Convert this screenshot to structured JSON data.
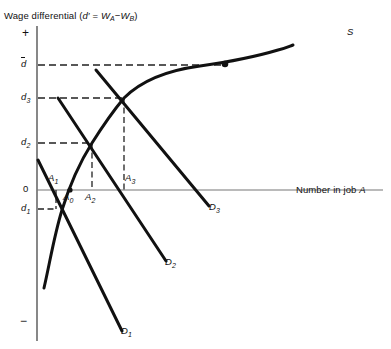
{
  "figure": {
    "width": 391,
    "height": 349,
    "background": "#ffffff",
    "ink": "#111111",
    "axis_color": "#555555",
    "title": "Wage differential (d′ = W",
    "title_full": "Wage differential (d' = WA−WB)",
    "title_parts": {
      "lead": "Wage differential (",
      "d": "d",
      "prime": "′",
      "eq": " = ",
      "w1": "W",
      "sub1": "A",
      "minus": "−",
      "w2": "W",
      "sub2": "B",
      "close": ")"
    },
    "x_axis_label": "Number in job A",
    "x_axis_label_parts": {
      "text": "Number in job ",
      "italic": "A"
    },
    "y_axis_plus": "+",
    "y_axis_minus": "−",
    "y_ticks": [
      {
        "id": "dbar",
        "label": "d",
        "accent": "bar",
        "subscript": "",
        "y": 65
      },
      {
        "id": "d3",
        "label": "d",
        "accent": "none",
        "subscript": "3",
        "y": 98
      },
      {
        "id": "d2",
        "label": "d",
        "accent": "none",
        "subscript": "2",
        "y": 143
      },
      {
        "id": "origin",
        "label": "0",
        "accent": "none",
        "subscript": "",
        "y": 190
      },
      {
        "id": "d1",
        "label": "d",
        "accent": "none",
        "subscript": "1",
        "y": 209
      }
    ],
    "x_points": [
      {
        "id": "A1",
        "label": "A",
        "subscript": "1",
        "x": 56,
        "y_label": 181
      },
      {
        "id": "A0",
        "label": "A",
        "subscript": "0",
        "x": 71,
        "y_label": 199
      },
      {
        "id": "A2",
        "label": "A",
        "subscript": "2",
        "x": 92,
        "y_label": 199
      },
      {
        "id": "A3",
        "label": "A",
        "subscript": "3",
        "x": 124,
        "y_label": 181
      }
    ],
    "curves": [
      {
        "id": "S",
        "label": "S",
        "type": "supply",
        "label_x": 347,
        "label_y": 33
      },
      {
        "id": "D1",
        "label": "D",
        "subscript": "1",
        "type": "demand",
        "label_x": 170,
        "label_y": 332
      },
      {
        "id": "D2",
        "label": "D",
        "subscript": "2",
        "type": "demand",
        "label_x": 172,
        "label_y": 265
      },
      {
        "id": "D3",
        "label": "D",
        "subscript": "3",
        "type": "demand",
        "label_x": 213,
        "label_y": 210
      }
    ],
    "marked_point": {
      "id": "dbar-point",
      "x": 225,
      "y": 64
    },
    "equilibria": [
      {
        "id": "eq1",
        "x": 56,
        "y": 209,
        "d": "d1",
        "a": "A1"
      },
      {
        "id": "eq2",
        "x": 92,
        "y": 143,
        "d": "d2",
        "a": "A2"
      },
      {
        "id": "eq3",
        "x": 124,
        "y": 98,
        "d": "d3",
        "a": "A3"
      }
    ]
  }
}
